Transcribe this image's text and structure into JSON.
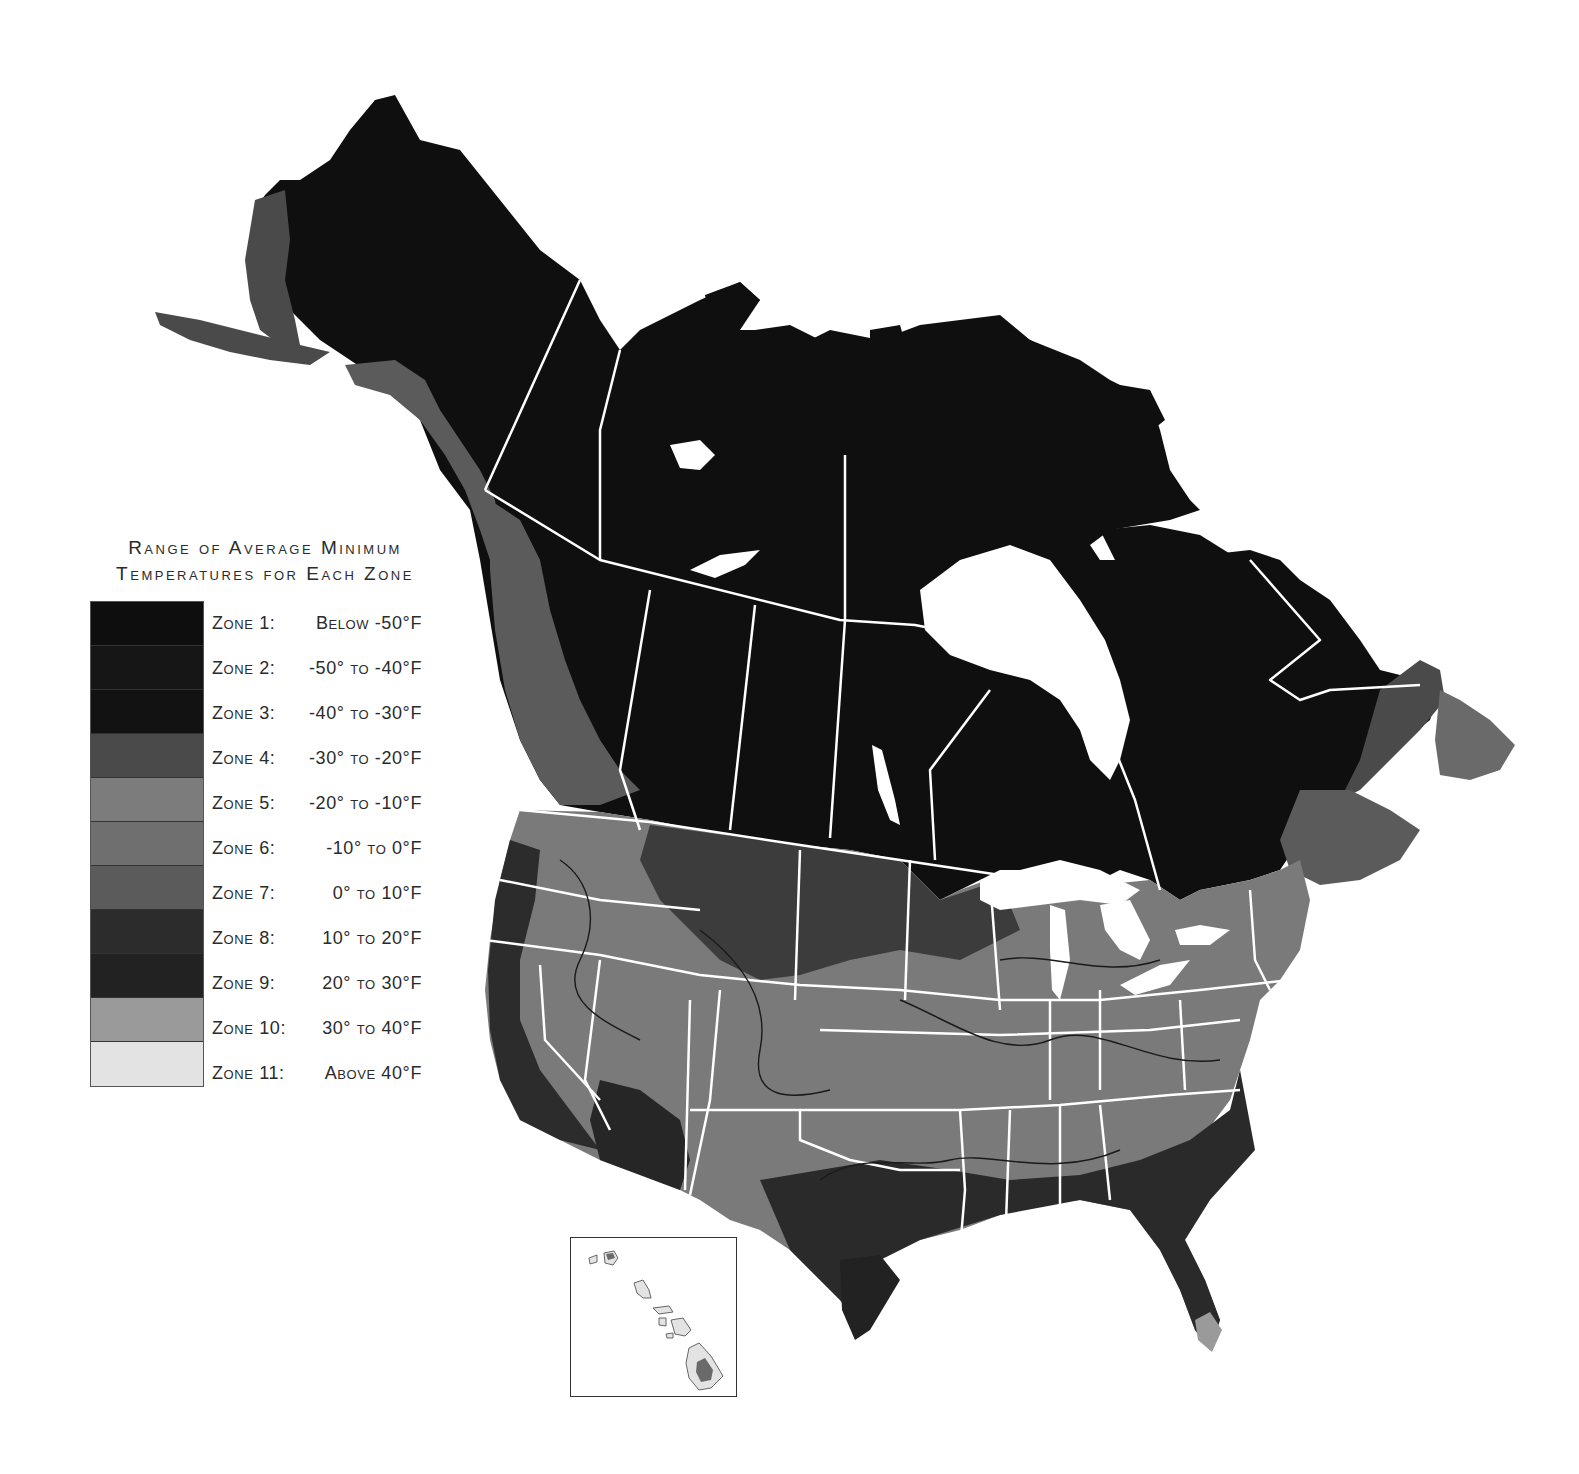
{
  "legend": {
    "title_line1": "Range of Average Minimum",
    "title_line2": "Temperatures for Each Zone",
    "zones": [
      {
        "label": "Zone 1:",
        "range": "Below -50°F",
        "color": "#0e0e0e"
      },
      {
        "label": "Zone 2:",
        "range": "-50° to -40°F",
        "color": "#161616"
      },
      {
        "label": "Zone 3:",
        "range": "-40° to -30°F",
        "color": "#121212"
      },
      {
        "label": "Zone 4:",
        "range": "-30° to -20°F",
        "color": "#4a4a4a"
      },
      {
        "label": "Zone 5:",
        "range": "-20° to -10°F",
        "color": "#7c7c7c"
      },
      {
        "label": "Zone 6:",
        "range": "-10° to 0°F",
        "color": "#6f6f6f"
      },
      {
        "label": "Zone 7:",
        "range": "0° to 10°F",
        "color": "#5b5b5b"
      },
      {
        "label": "Zone 8:",
        "range": "10° to 20°F",
        "color": "#2c2c2c"
      },
      {
        "label": "Zone 9:",
        "range": "20° to 30°F",
        "color": "#222222"
      },
      {
        "label": "Zone 10:",
        "range": "30° to 40°F",
        "color": "#9a9a9a"
      },
      {
        "label": "Zone 11:",
        "range": "Above 40°F",
        "color": "#e3e3e3"
      }
    ]
  },
  "map": {
    "subject": "Plant hardiness zones of North America (USA, Canada, Alaska)",
    "inset": "Hawaii",
    "colors": {
      "background": "#ffffff",
      "boundary": "#ffffff",
      "contour": "#1a1a1a",
      "north": "#0f0f0f"
    }
  }
}
